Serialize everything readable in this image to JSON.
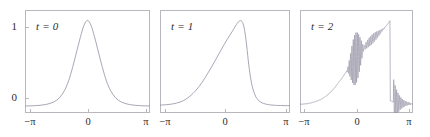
{
  "figure": {
    "width": 430,
    "height": 137,
    "background": "#ffffff",
    "curve_color": "#9a96a8",
    "frame_color": "#b9b7bd",
    "text_color": "#2b2b2b"
  },
  "panels": [
    {
      "label": "t = 0",
      "frame": {
        "left": 25,
        "top": 10,
        "width": 125,
        "height": 103
      },
      "y_axis": {
        "show_labels": true,
        "ticks": [
          {
            "label": "1",
            "value": 1,
            "y": 27
          },
          {
            "label": "0",
            "value": 0,
            "y": 98
          }
        ]
      },
      "x_axis": {
        "ticks": [
          {
            "label": "−π",
            "value": -3.14159,
            "x": 30
          },
          {
            "label": "0",
            "value": 0,
            "x": 88
          },
          {
            "label": "π",
            "value": 3.14159,
            "x": 146
          }
        ]
      }
    },
    {
      "label": "t = 1",
      "frame": {
        "left": 160,
        "top": 10,
        "width": 130,
        "height": 103
      },
      "y_axis": {
        "show_labels": false,
        "ticks": []
      },
      "x_axis": {
        "ticks": [
          {
            "label": "−π",
            "value": -3.14159,
            "x": 165
          },
          {
            "label": "0",
            "value": 0,
            "x": 225
          },
          {
            "label": "π",
            "value": 3.14159,
            "x": 286
          }
        ]
      }
    },
    {
      "label": "t = 2",
      "frame": {
        "left": 300,
        "top": 10,
        "width": 113,
        "height": 103
      },
      "y_axis": {
        "show_labels": false,
        "ticks": []
      },
      "x_axis": {
        "ticks": [
          {
            "label": "−π",
            "value": -3.14159,
            "x": 304
          },
          {
            "label": "0",
            "value": 0,
            "x": 357
          },
          {
            "label": "π",
            "value": 3.14159,
            "x": 409
          }
        ]
      }
    }
  ],
  "chart_data": {
    "type": "line",
    "title": "",
    "subtitle": "",
    "xlabel": "",
    "ylabel": "",
    "grid": false,
    "legend": null,
    "xlim": [
      -3.14159,
      3.14159
    ],
    "ylim": [
      -0.08,
      1.12
    ],
    "xticks": {
      "values": [
        -3.14159,
        0,
        3.14159
      ],
      "labels": [
        "−π",
        "0",
        "π"
      ]
    },
    "yticks": {
      "values": [
        0,
        1
      ],
      "labels": [
        "0",
        "1"
      ]
    },
    "series": [
      {
        "name": "t = 0",
        "annotation": "t = 0",
        "description": "symmetric bell-shaped pulse (sech-squared) centred at x = 0, peak value 1, baseline 0",
        "shape": "sech2",
        "peak_x": 0.0,
        "peak_y": 1.0,
        "width": 0.62,
        "oscillatory": false,
        "points": [
          {
            "x": -3.14159,
            "y": 0.002
          },
          {
            "x": -2.6,
            "y": 0.006
          },
          {
            "x": -2.1,
            "y": 0.019
          },
          {
            "x": -1.7,
            "y": 0.048
          },
          {
            "x": -1.4,
            "y": 0.1
          },
          {
            "x": -1.15,
            "y": 0.185
          },
          {
            "x": -0.95,
            "y": 0.295
          },
          {
            "x": -0.75,
            "y": 0.45
          },
          {
            "x": -0.55,
            "y": 0.63
          },
          {
            "x": -0.35,
            "y": 0.81
          },
          {
            "x": -0.18,
            "y": 0.94
          },
          {
            "x": 0.0,
            "y": 1.0
          },
          {
            "x": 0.18,
            "y": 0.94
          },
          {
            "x": 0.35,
            "y": 0.81
          },
          {
            "x": 0.55,
            "y": 0.63
          },
          {
            "x": 0.75,
            "y": 0.45
          },
          {
            "x": 0.95,
            "y": 0.295
          },
          {
            "x": 1.15,
            "y": 0.185
          },
          {
            "x": 1.4,
            "y": 0.1
          },
          {
            "x": 1.7,
            "y": 0.048
          },
          {
            "x": 2.1,
            "y": 0.019
          },
          {
            "x": 2.6,
            "y": 0.006
          },
          {
            "x": 3.14159,
            "y": 0.002
          }
        ]
      },
      {
        "name": "t = 1",
        "annotation": "t = 1",
        "description": "pulse steepened and skewed to the right; gentle rise on the left, peak near x = 0.75 at height ~1, very steep fall on the right back to 0",
        "shape": "skewed-steepened",
        "peak_x": 0.75,
        "peak_y": 1.0,
        "oscillatory": false,
        "points": [
          {
            "x": -3.14159,
            "y": 0.012
          },
          {
            "x": -2.7,
            "y": 0.02
          },
          {
            "x": -2.35,
            "y": 0.035
          },
          {
            "x": -2.0,
            "y": 0.065
          },
          {
            "x": -1.7,
            "y": 0.115
          },
          {
            "x": -1.4,
            "y": 0.185
          },
          {
            "x": -1.1,
            "y": 0.28
          },
          {
            "x": -0.8,
            "y": 0.395
          },
          {
            "x": -0.5,
            "y": 0.52
          },
          {
            "x": -0.2,
            "y": 0.65
          },
          {
            "x": 0.1,
            "y": 0.775
          },
          {
            "x": 0.35,
            "y": 0.87
          },
          {
            "x": 0.55,
            "y": 0.95
          },
          {
            "x": 0.72,
            "y": 0.995
          },
          {
            "x": 0.85,
            "y": 0.975
          },
          {
            "x": 0.95,
            "y": 0.88
          },
          {
            "x": 1.05,
            "y": 0.7
          },
          {
            "x": 1.15,
            "y": 0.48
          },
          {
            "x": 1.28,
            "y": 0.27
          },
          {
            "x": 1.45,
            "y": 0.13
          },
          {
            "x": 1.65,
            "y": 0.06
          },
          {
            "x": 1.95,
            "y": 0.025
          },
          {
            "x": 2.4,
            "y": 0.01
          },
          {
            "x": 3.14159,
            "y": 0.005
          }
        ]
      },
      {
        "name": "t = 2",
        "annotation": "t = 2",
        "description": "dispersive shock: smooth rise from 0, burst of high-frequency oscillations around x = 0, ramp continuing to a peak near x = 1.85, abrupt near-vertical drop to 0, then rapidly damped oscillations decaying to the baseline",
        "shape": "dispersive-shock",
        "peak_x": 1.85,
        "peak_y": 1.0,
        "oscillatory": true,
        "oscillation_zones": [
          {
            "center_x": -0.05,
            "half_width": 0.55,
            "max_amplitude": 0.3,
            "wavelength": 0.075
          },
          {
            "center_x": 0.85,
            "half_width": 0.85,
            "max_amplitude": 0.055,
            "wavelength": 0.085
          },
          {
            "center_x": 2.05,
            "half_width": 0.95,
            "max_amplitude": 0.28,
            "wavelength": 0.08,
            "decaying": true
          }
        ],
        "baseline_points": [
          {
            "x": -3.14159,
            "y": 0.02
          },
          {
            "x": -2.7,
            "y": 0.03
          },
          {
            "x": -2.35,
            "y": 0.048
          },
          {
            "x": -2.0,
            "y": 0.075
          },
          {
            "x": -1.7,
            "y": 0.115
          },
          {
            "x": -1.4,
            "y": 0.17
          },
          {
            "x": -1.1,
            "y": 0.245
          },
          {
            "x": -0.8,
            "y": 0.33
          },
          {
            "x": -0.5,
            "y": 0.42
          },
          {
            "x": -0.2,
            "y": 0.51
          },
          {
            "x": 0.1,
            "y": 0.595
          },
          {
            "x": 0.4,
            "y": 0.675
          },
          {
            "x": 0.7,
            "y": 0.745
          },
          {
            "x": 1.0,
            "y": 0.805
          },
          {
            "x": 1.3,
            "y": 0.86
          },
          {
            "x": 1.55,
            "y": 0.91
          },
          {
            "x": 1.75,
            "y": 0.96
          },
          {
            "x": 1.86,
            "y": 0.995
          },
          {
            "x": 1.88,
            "y": 0.06
          },
          {
            "x": 2.2,
            "y": 0.04
          },
          {
            "x": 2.6,
            "y": 0.03
          },
          {
            "x": 3.14159,
            "y": 0.028
          }
        ]
      }
    ]
  }
}
